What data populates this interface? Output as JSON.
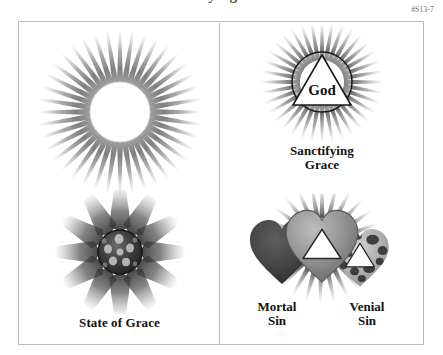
{
  "page": {
    "title_cropped": "Sanctifying Grace",
    "plate_id": "#S13-7",
    "background_color": "#ffffff",
    "frame_color": "#b9b9b9",
    "ink_color": "#111111"
  },
  "panels": [
    {
      "id": "left",
      "figures": [
        {
          "name": "sun-bright-disc",
          "caption": "",
          "description": "bright white disc with radiating gray rays",
          "disc_fill": "#ffffff",
          "ray_color": "#555555",
          "ray_count": 40
        },
        {
          "name": "sun-dark-disc",
          "caption": "State of Grace",
          "description": "dark mottled disc with broad radiating petal rays",
          "disc_fill": "#3a3a3a",
          "ray_color": "#4a4a4a",
          "ray_count": 12
        }
      ]
    },
    {
      "id": "right",
      "figures": [
        {
          "name": "god-triangle-in-circle",
          "caption": "Sanctifying\nGrace",
          "inner_label": "God",
          "description": "white triangle labeled God inside an outlined circle with rays",
          "triangle_fill": "#ffffff",
          "circle_stroke": "#1a1a1a",
          "ray_color": "#4a4a4a"
        },
        {
          "name": "three-hearts-sin",
          "caption_left": "Mortal\nSin",
          "caption_right": "Venial\nSin",
          "hearts": [
            {
              "name": "mortal-sin-heart",
              "label": "Mortal\nSin",
              "fill": "#4b4b4b",
              "has_triangle": false,
              "has_spots": false,
              "has_rays": false
            },
            {
              "name": "grace-heart",
              "label": "",
              "fill": "#9a9a9a",
              "has_triangle": true,
              "has_spots": false,
              "has_rays": true
            },
            {
              "name": "venial-sin-heart",
              "label": "Venial\nSin",
              "fill": "#b5b5b5",
              "has_triangle": true,
              "has_spots": true,
              "has_rays": false
            }
          ]
        }
      ]
    }
  ]
}
